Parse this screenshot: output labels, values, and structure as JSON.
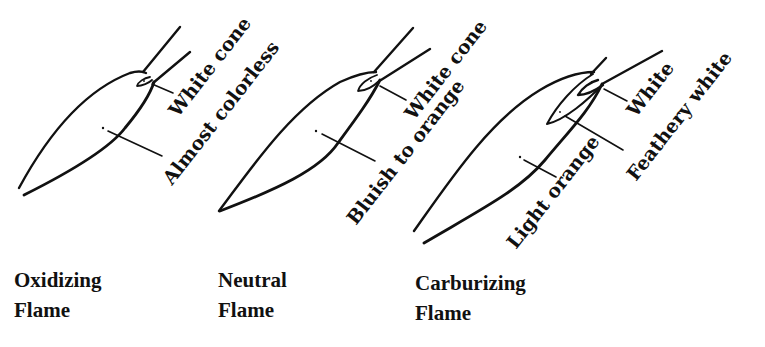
{
  "flames": [
    {
      "id": "oxidizing",
      "caption": [
        "Oxidizing",
        "Flame"
      ],
      "labels": {
        "inner_cone": "White cone",
        "envelope": "Almost colorless"
      }
    },
    {
      "id": "neutral",
      "caption": [
        "Neutral",
        "Flame"
      ],
      "labels": {
        "inner_cone": "White cone",
        "envelope": "Bluish to orange"
      }
    },
    {
      "id": "carburizing",
      "caption": [
        "Carburizing",
        "Flame"
      ],
      "labels": {
        "inner_cone": "White",
        "feather": "Feathery white",
        "envelope": "Light orange"
      }
    }
  ],
  "colors": {
    "ink": "#111111",
    "background": "#ffffff"
  }
}
